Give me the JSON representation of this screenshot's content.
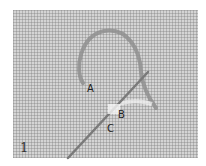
{
  "figure": {
    "step_number": "1",
    "labels": {
      "a": "A",
      "b": "B",
      "c": "C"
    },
    "colors": {
      "fabric": "#d4d4d4",
      "thread": "#8a8a8a",
      "needle": "#7a7a7a",
      "background": "#ffffff"
    }
  }
}
